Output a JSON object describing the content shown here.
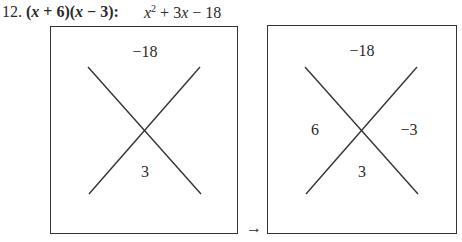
{
  "problem": {
    "number": "12.",
    "factored_parts": [
      "(",
      "x",
      " + 6)(",
      "x",
      " − 3):"
    ],
    "expanded": {
      "x_sq_base": "x",
      "x_sq_exp": "2",
      "middle": " + 3",
      "x": "x",
      "tail": " − 18"
    }
  },
  "diagrams": [
    {
      "name": "x-box-initial",
      "top": "−18",
      "bottom": "3",
      "left": "",
      "right": ""
    },
    {
      "name": "x-box-solved",
      "top": "−18",
      "bottom": "3",
      "left": "6",
      "right": "−3"
    }
  ],
  "arrow": "→",
  "colors": {
    "ink": "#2a2a2a",
    "border": "#333333",
    "background": "#ffffff"
  }
}
